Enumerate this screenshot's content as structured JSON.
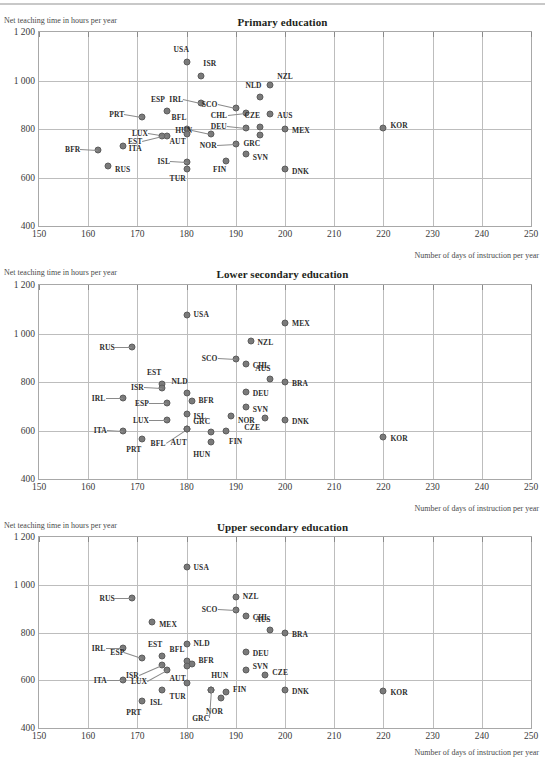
{
  "figure": {
    "ylabel": "Net teaching time in hours per year",
    "xlabel": "Number of days of instruction per year",
    "yticks": [
      "1 200",
      "1 000",
      "800",
      "600",
      "400"
    ],
    "xticks": [
      "150",
      "160",
      "170",
      "180",
      "190",
      "200",
      "210",
      "220",
      "230",
      "240",
      "250"
    ],
    "marker_color": "#7a7a7a",
    "grid_color": "#bdbdbd",
    "axis_color": "#a8a8a8"
  },
  "chart_data": [
    {
      "type": "scatter",
      "title": "Primary education",
      "xlabel": "Number of days of instruction per year",
      "ylabel": "Net teaching time in hours per year",
      "xlim": [
        150,
        250
      ],
      "ylim": [
        400,
        1200
      ],
      "xticks": [
        150,
        160,
        170,
        180,
        190,
        200,
        210,
        220,
        230,
        240,
        250
      ],
      "yticks": [
        400,
        600,
        800,
        1000,
        1200
      ],
      "grid": true,
      "legend": "none",
      "points": [
        {
          "label": "USA",
          "x": 180,
          "y": 1075,
          "lx": -2,
          "ly": -13
        },
        {
          "label": "ISR",
          "x": 183,
          "y": 1020,
          "lx": 2,
          "ly": -13
        },
        {
          "label": "NZL",
          "x": 197,
          "y": 983,
          "lx": 7,
          "ly": -9
        },
        {
          "label": "NLD",
          "x": 195,
          "y": 930,
          "lx": -3,
          "ly": -12
        },
        {
          "label": "IRL",
          "x": 183,
          "y": 908,
          "lx": -22,
          "ly": -4
        },
        {
          "label": "SCO",
          "x": 190,
          "y": 888,
          "lx": -22,
          "ly": -4
        },
        {
          "label": "ESP",
          "x": 176,
          "y": 875,
          "lx": -6,
          "ly": -12
        },
        {
          "label": "CHL",
          "x": 192,
          "y": 868,
          "lx": -22,
          "ly": 2
        },
        {
          "label": "AUS",
          "x": 197,
          "y": 860,
          "lx": 7,
          "ly": 1
        },
        {
          "label": "PRT",
          "x": 171,
          "y": 850,
          "lx": -22,
          "ly": -3
        },
        {
          "label": "CZE",
          "x": 195,
          "y": 810,
          "lx": -4,
          "ly": -12
        },
        {
          "label": "BFL",
          "x": 180,
          "y": 800,
          "lx": -4,
          "ly": -12
        },
        {
          "label": "DEU",
          "x": 192,
          "y": 805,
          "lx": -23,
          "ly": -2
        },
        {
          "label": "MEX",
          "x": 200,
          "y": 798,
          "lx": 7,
          "ly": 1
        },
        {
          "label": "KOR",
          "x": 220,
          "y": 805,
          "lx": 7,
          "ly": -3
        },
        {
          "label": "LUX",
          "x": 176,
          "y": 772,
          "lx": -23,
          "ly": -3
        },
        {
          "label": "EST",
          "x": 175,
          "y": 770,
          "lx": -24,
          "ly": 5
        },
        {
          "label": "HUN",
          "x": 185,
          "y": 778,
          "lx": -23,
          "ly": -4
        },
        {
          "label": "AUT",
          "x": 180,
          "y": 778,
          "lx": -5,
          "ly": 7
        },
        {
          "label": "GRC",
          "x": 195,
          "y": 775,
          "lx": -4,
          "ly": 8
        },
        {
          "label": "NOR",
          "x": 190,
          "y": 738,
          "lx": -23,
          "ly": 1
        },
        {
          "label": "ITA",
          "x": 167,
          "y": 730,
          "lx": 6,
          "ly": 2
        },
        {
          "label": "BFR",
          "x": 162,
          "y": 715,
          "lx": -22,
          "ly": -1
        },
        {
          "label": "SVN",
          "x": 192,
          "y": 695,
          "lx": 7,
          "ly": 3
        },
        {
          "label": "FIN",
          "x": 188,
          "y": 670,
          "lx": -4,
          "ly": 8
        },
        {
          "label": "ISL",
          "x": 180,
          "y": 665,
          "lx": -21,
          "ly": -1
        },
        {
          "label": "RUS",
          "x": 164,
          "y": 648,
          "lx": 7,
          "ly": 3
        },
        {
          "label": "DNK",
          "x": 200,
          "y": 633,
          "lx": 7,
          "ly": 2
        },
        {
          "label": "TUR",
          "x": 180,
          "y": 635,
          "lx": -5,
          "ly": 9
        }
      ]
    },
    {
      "type": "scatter",
      "title": "Lower secondary education",
      "xlabel": "Number of days of instruction per year",
      "ylabel": "Net teaching time in hours per year",
      "xlim": [
        150,
        250
      ],
      "ylim": [
        400,
        1200
      ],
      "xticks": [
        150,
        160,
        170,
        180,
        190,
        200,
        210,
        220,
        230,
        240,
        250
      ],
      "yticks": [
        400,
        600,
        800,
        1000,
        1200
      ],
      "grid": true,
      "legend": "none",
      "points": [
        {
          "label": "USA",
          "x": 180,
          "y": 1078,
          "lx": 7,
          "ly": -1
        },
        {
          "label": "MEX",
          "x": 200,
          "y": 1045,
          "lx": 7,
          "ly": 0
        },
        {
          "label": "NZL",
          "x": 193,
          "y": 968,
          "lx": 7,
          "ly": 1
        },
        {
          "label": "RUS",
          "x": 169,
          "y": 945,
          "lx": -22,
          "ly": 0
        },
        {
          "label": "SCO",
          "x": 190,
          "y": 893,
          "lx": -22,
          "ly": -1
        },
        {
          "label": "CHL",
          "x": 192,
          "y": 873,
          "lx": 7,
          "ly": 1
        },
        {
          "label": "AUS",
          "x": 197,
          "y": 812,
          "lx": -4,
          "ly": -11
        },
        {
          "label": "BRA",
          "x": 200,
          "y": 800,
          "lx": 7,
          "ly": 1
        },
        {
          "label": "EST",
          "x": 175,
          "y": 793,
          "lx": -5,
          "ly": -12
        },
        {
          "label": "ISR",
          "x": 175,
          "y": 775,
          "lx": -22,
          "ly": -1
        },
        {
          "label": "NLD",
          "x": 180,
          "y": 755,
          "lx": -3,
          "ly": -12
        },
        {
          "label": "DEU",
          "x": 192,
          "y": 760,
          "lx": 7,
          "ly": 1
        },
        {
          "label": "IRL",
          "x": 167,
          "y": 735,
          "lx": -21,
          "ly": 0
        },
        {
          "label": "BFR",
          "x": 181,
          "y": 723,
          "lx": 7,
          "ly": -1
        },
        {
          "label": "ESP",
          "x": 176,
          "y": 715,
          "lx": -22,
          "ly": 0
        },
        {
          "label": "SVN",
          "x": 192,
          "y": 698,
          "lx": 7,
          "ly": 2
        },
        {
          "label": "ISL",
          "x": 180,
          "y": 670,
          "lx": 7,
          "ly": 2
        },
        {
          "label": "NOR",
          "x": 189,
          "y": 658,
          "lx": 7,
          "ly": 4
        },
        {
          "label": "CZE",
          "x": 196,
          "y": 650,
          "lx": -9,
          "ly": 9
        },
        {
          "label": "LUX",
          "x": 176,
          "y": 645,
          "lx": -22,
          "ly": 0
        },
        {
          "label": "DNK",
          "x": 200,
          "y": 645,
          "lx": 7,
          "ly": 1
        },
        {
          "label": "ITA",
          "x": 167,
          "y": 600,
          "lx": -20,
          "ly": -1
        },
        {
          "label": "BFL",
          "x": 180,
          "y": 608,
          "lx": -25,
          "ly": 14
        },
        {
          "label": "AUT",
          "x": 180,
          "y": 608,
          "lx": -4,
          "ly": 13
        },
        {
          "label": "GRC",
          "x": 185,
          "y": 592,
          "lx": -5,
          "ly": -11
        },
        {
          "label": "FIN",
          "x": 188,
          "y": 597,
          "lx": 3,
          "ly": 10
        },
        {
          "label": "KOR",
          "x": 220,
          "y": 572,
          "lx": 7,
          "ly": 1
        },
        {
          "label": "PRT",
          "x": 171,
          "y": 565,
          "lx": -5,
          "ly": 10
        },
        {
          "label": "HUN",
          "x": 185,
          "y": 553,
          "lx": -5,
          "ly": 12
        }
      ]
    },
    {
      "type": "scatter",
      "title": "Upper secondary education",
      "xlabel": "Number of days of instruction per year",
      "ylabel": "Net teaching time in hours per year",
      "xlim": [
        150,
        250
      ],
      "ylim": [
        400,
        1200
      ],
      "xticks": [
        150,
        160,
        170,
        180,
        190,
        200,
        210,
        220,
        230,
        240,
        250
      ],
      "yticks": [
        400,
        600,
        800,
        1000,
        1200
      ],
      "grid": true,
      "legend": "none",
      "points": [
        {
          "label": "USA",
          "x": 180,
          "y": 1075,
          "lx": 7,
          "ly": 0
        },
        {
          "label": "NZL",
          "x": 190,
          "y": 948,
          "lx": 7,
          "ly": -1
        },
        {
          "label": "RUS",
          "x": 169,
          "y": 943,
          "lx": -22,
          "ly": 0
        },
        {
          "label": "SCO",
          "x": 190,
          "y": 893,
          "lx": -22,
          "ly": -1
        },
        {
          "label": "CHL",
          "x": 192,
          "y": 870,
          "lx": 7,
          "ly": 1
        },
        {
          "label": "MEX",
          "x": 173,
          "y": 845,
          "lx": 7,
          "ly": 2
        },
        {
          "label": "AUS",
          "x": 197,
          "y": 810,
          "lx": -4,
          "ly": -11
        },
        {
          "label": "BRA",
          "x": 200,
          "y": 800,
          "lx": 7,
          "ly": 1
        },
        {
          "label": "NLD",
          "x": 180,
          "y": 752,
          "lx": 7,
          "ly": -1
        },
        {
          "label": "IRL",
          "x": 167,
          "y": 735,
          "lx": -21,
          "ly": 0
        },
        {
          "label": "DEU",
          "x": 192,
          "y": 718,
          "lx": 7,
          "ly": 1
        },
        {
          "label": "EST",
          "x": 175,
          "y": 700,
          "lx": -4,
          "ly": -12
        },
        {
          "label": "ESP",
          "x": 171,
          "y": 692,
          "lx": -22,
          "ly": -6
        },
        {
          "label": "BFL",
          "x": 180,
          "y": 680,
          "lx": -6,
          "ly": -12
        },
        {
          "label": "BFR",
          "x": 181,
          "y": 668,
          "lx": 7,
          "ly": -4
        },
        {
          "label": "ISR",
          "x": 175,
          "y": 662,
          "lx": -27,
          "ly": 10
        },
        {
          "label": "SVN",
          "x": 192,
          "y": 645,
          "lx": 7,
          "ly": -4
        },
        {
          "label": "LUX",
          "x": 176,
          "y": 643,
          "lx": -24,
          "ly": 11
        },
        {
          "label": "AUT",
          "x": 180,
          "y": 660,
          "lx": -5,
          "ly": 12
        },
        {
          "label": "CZE",
          "x": 196,
          "y": 620,
          "lx": 7,
          "ly": -3
        },
        {
          "label": "ITA",
          "x": 167,
          "y": 600,
          "lx": -20,
          "ly": 0
        },
        {
          "label": "TUR",
          "x": 180,
          "y": 588,
          "lx": -5,
          "ly": 13
        },
        {
          "label": "HUN",
          "x": 185,
          "y": 558,
          "lx": 0,
          "ly": -15
        },
        {
          "label": "DNK",
          "x": 200,
          "y": 560,
          "lx": 7,
          "ly": 1
        },
        {
          "label": "FIN",
          "x": 188,
          "y": 552,
          "lx": 7,
          "ly": -3
        },
        {
          "label": "ISL",
          "x": 175,
          "y": 560,
          "lx": -4,
          "ly": 12
        },
        {
          "label": "KOR",
          "x": 220,
          "y": 555,
          "lx": 7,
          "ly": 1
        },
        {
          "label": "NOR",
          "x": 187,
          "y": 527,
          "lx": -2,
          "ly": 13
        },
        {
          "label": "GRC",
          "x": 185,
          "y": 558,
          "lx": -6,
          "ly": 28
        },
        {
          "label": "PRT",
          "x": 171,
          "y": 515,
          "lx": -5,
          "ly": 11
        }
      ]
    }
  ]
}
